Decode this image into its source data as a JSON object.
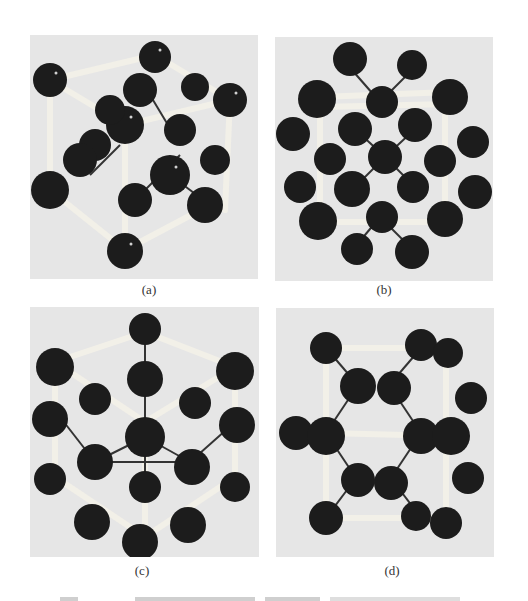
{
  "figure": {
    "panels": [
      {
        "id": "a",
        "label": "(a)",
        "description": "ball-and-stick crystal model, cubic cell view"
      },
      {
        "id": "b",
        "label": "(b)",
        "description": "ball-and-stick crystal model, hexagonal ring view"
      },
      {
        "id": "c",
        "label": "(c)",
        "description": "ball-and-stick crystal model, diamond-like view along body diagonal"
      },
      {
        "id": "d",
        "label": "(d)",
        "description": "ball-and-stick crystal model, hexagonal cell side view"
      }
    ],
    "caption": ""
  },
  "colors": {
    "panel_background": "#e6e6e6",
    "atom": "#1c1c1c",
    "bond_light": "#f4f2ea",
    "bond_dark": "#333333"
  }
}
